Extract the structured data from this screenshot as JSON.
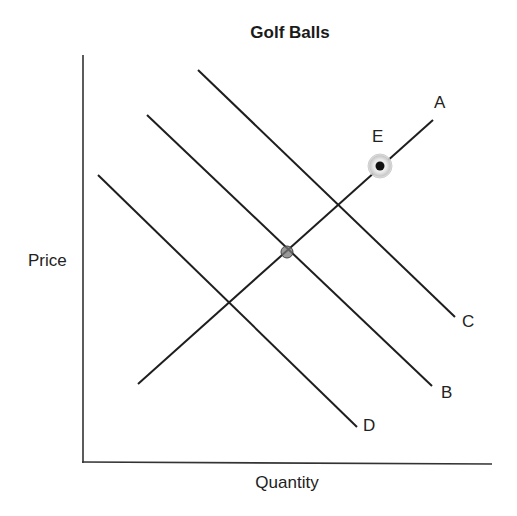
{
  "title": "Golf Balls",
  "axes": {
    "x_label": "Quantity",
    "y_label": "Price"
  },
  "curves": [
    {
      "id": "A",
      "label": "A",
      "kind": "supply",
      "x1": 138,
      "y1": 384,
      "x2": 433,
      "y2": 120,
      "label_x": 434,
      "label_y": 108
    },
    {
      "id": "B",
      "label": "B",
      "kind": "demand",
      "x1": 147,
      "y1": 115,
      "x2": 432,
      "y2": 386,
      "label_x": 441,
      "label_y": 398
    },
    {
      "id": "C",
      "label": "C",
      "kind": "demand",
      "x1": 198,
      "y1": 70,
      "x2": 455,
      "y2": 317,
      "label_x": 462,
      "label_y": 327
    },
    {
      "id": "D",
      "label": "D",
      "kind": "demand",
      "x1": 98,
      "y1": 175,
      "x2": 357,
      "y2": 427,
      "label_x": 363,
      "label_y": 431
    }
  ],
  "points": [
    {
      "id": "E",
      "label": "E",
      "x": 380,
      "y": 166,
      "label_x": 372,
      "label_y": 142,
      "style": "highlighted"
    },
    {
      "id": "intersection-AB",
      "label": "",
      "x": 287,
      "y": 252,
      "style": "marker"
    }
  ],
  "chart_data": {
    "type": "line",
    "title": "Golf Balls",
    "xlabel": "Quantity",
    "ylabel": "Price",
    "grid": false,
    "ticks": false,
    "series": [
      {
        "name": "A",
        "role": "supply (upward sloping)"
      },
      {
        "name": "B",
        "role": "demand (downward sloping, middle)"
      },
      {
        "name": "C",
        "role": "demand (downward sloping, shifted right)"
      },
      {
        "name": "D",
        "role": "demand (downward sloping, shifted left)"
      }
    ],
    "annotations": [
      {
        "label": "E",
        "description": "equilibrium point on A where it crosses C (highlighted dot)"
      },
      {
        "label": "",
        "description": "equilibrium point where A intersects B"
      }
    ]
  }
}
